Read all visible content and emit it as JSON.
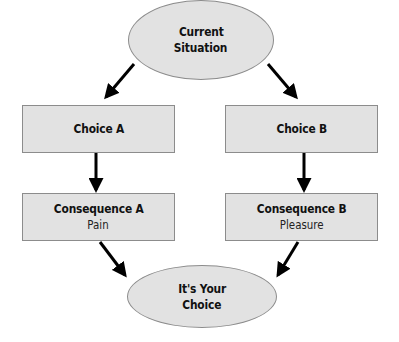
{
  "diagram": {
    "top_node": {
      "line1": "Current",
      "line2": "Situation"
    },
    "choice_a": {
      "label": "Choice A"
    },
    "choice_b": {
      "label": "Choice B"
    },
    "consequence_a": {
      "title": "Consequence A",
      "detail": "Pain"
    },
    "consequence_b": {
      "title": "Consequence B",
      "detail": "Pleasure"
    },
    "bottom_node": {
      "line1": "It's Your",
      "line2": "Choice"
    }
  },
  "colors": {
    "node_fill": "#e2e2e2",
    "node_border": "#8c8c8c",
    "arrow": "#000000"
  }
}
